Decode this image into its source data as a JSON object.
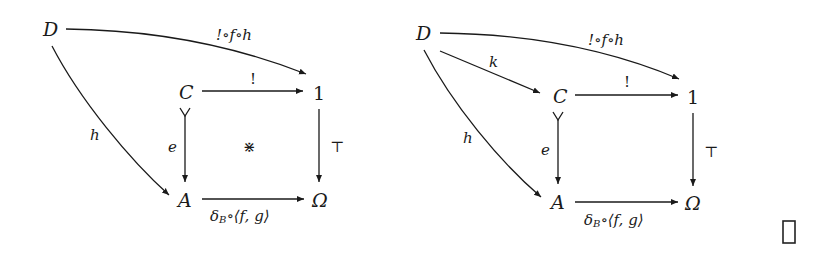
{
  "diagrams": [
    {
      "id": "pullback-square",
      "nodes": {
        "D": "D",
        "C": "C",
        "one": "1",
        "A": "A",
        "Omega": "Ω"
      },
      "arrows": {
        "D_to_1": "!∘f∘h",
        "C_to_1": "!",
        "C_to_A": "e",
        "one_to_Omega": "⊤",
        "A_to_Omega_main": "δ",
        "A_to_Omega_sub": "B",
        "A_to_Omega_rest": "∘⟨f, g⟩",
        "D_to_A": "h"
      },
      "center_mark": "⋇"
    },
    {
      "id": "mediating-arrow",
      "nodes": {
        "D": "D",
        "C": "C",
        "one": "1",
        "A": "A",
        "Omega": "Ω"
      },
      "arrows": {
        "D_to_1": "!∘f∘h",
        "D_to_C": "k",
        "C_to_1": "!",
        "C_to_A": "e",
        "one_to_Omega": "⊤",
        "A_to_Omega_main": "δ",
        "A_to_Omega_sub": "B",
        "A_to_Omega_rest": "∘⟨f, g⟩",
        "D_to_A": "h"
      }
    }
  ],
  "end_of_proof": "□"
}
